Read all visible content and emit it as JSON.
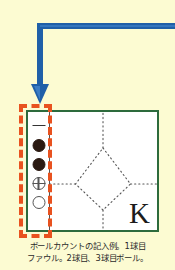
{
  "page": {
    "background_color": "#fcfbd2"
  },
  "callout_arrow": {
    "name": "pointer-arrow",
    "color": "#1f5fa8",
    "direction": "down",
    "description": "blue elbow arrow pointing down to the ball-count column"
  },
  "highlight": {
    "name": "ball-count-highlight",
    "color": "#e8521f",
    "style": "dashed"
  },
  "scorecell": {
    "border_color": "#2d6b3c",
    "background": "#ffffff",
    "count_column": {
      "label": "ball-count-column",
      "marks": [
        {
          "id": "mark-1",
          "symbol": "dash",
          "meaning": "foul"
        },
        {
          "id": "mark-2",
          "symbol": "filled-circle",
          "meaning": "ball"
        },
        {
          "id": "mark-3",
          "symbol": "filled-circle",
          "meaning": "ball"
        },
        {
          "id": "mark-4",
          "symbol": "crossed-circle",
          "meaning": "strike"
        },
        {
          "id": "mark-5",
          "symbol": "open-circle",
          "meaning": "empty"
        }
      ]
    },
    "field": {
      "label": "diamond-field",
      "line_color": "#555555",
      "line_style": "dotted",
      "result_letter": "K"
    }
  },
  "caption": {
    "line1": "ボールカウントの記入例。1球目",
    "line2": "ファウル。2球目、3球目ボール。"
  }
}
